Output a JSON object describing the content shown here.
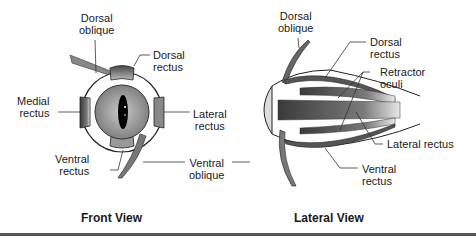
{
  "figure": {
    "front_view": {
      "title": "Front View",
      "labels": {
        "dorsal_oblique": [
          "Dorsal",
          "oblique"
        ],
        "dorsal_rectus": [
          "Dorsal",
          "rectus"
        ],
        "medial_rectus": [
          "Medial",
          "rectus"
        ],
        "lateral_rectus": [
          "Lateral",
          "rectus"
        ],
        "ventral_rectus": [
          "Ventral",
          "rectus"
        ],
        "ventral_oblique": [
          "Ventral",
          "oblique"
        ]
      }
    },
    "lateral_view": {
      "title": "Lateral View",
      "labels": {
        "dorsal_oblique": [
          "Dorsal",
          "oblique"
        ],
        "dorsal_rectus": [
          "Dorsal",
          "rectus"
        ],
        "retractor_oculi": [
          "Retractor",
          "oculi"
        ],
        "lateral_rectus": "Lateral rectus",
        "ventral_rectus": [
          "Ventral",
          "rectus"
        ]
      }
    },
    "colors": {
      "ink": "#1a1a1a",
      "iris": "#9a9a9a",
      "muscle": "#6e6e6e",
      "rule": "#555555"
    }
  }
}
